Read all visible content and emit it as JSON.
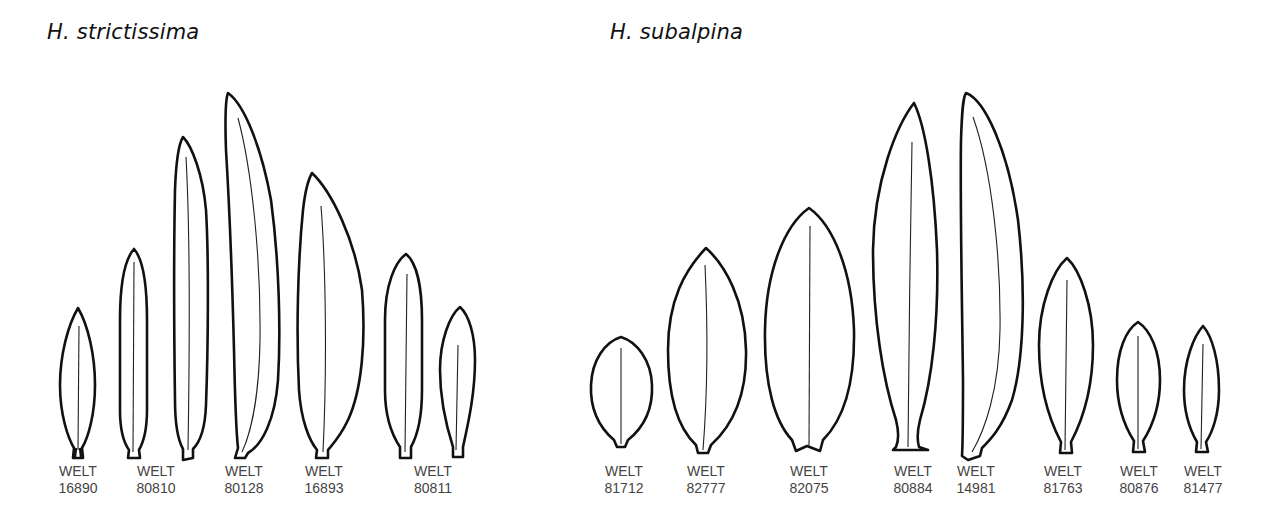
{
  "panels": [
    {
      "title": "H. strictissima",
      "specimens": [
        {
          "herbarium": "WELT",
          "number": "16890"
        },
        {
          "herbarium": "WELT",
          "number": "80810"
        },
        {
          "herbarium": "WELT",
          "number": "80128"
        },
        {
          "herbarium": "WELT",
          "number": "16893"
        },
        {
          "herbarium": "WELT",
          "number": "80811"
        }
      ],
      "leaf_count": 7
    },
    {
      "title": "H. subalpina",
      "specimens": [
        {
          "herbarium": "WELT",
          "number": "81712"
        },
        {
          "herbarium": "WELT",
          "number": "82777"
        },
        {
          "herbarium": "WELT",
          "number": "82075"
        },
        {
          "herbarium": "WELT",
          "number": "80884"
        },
        {
          "herbarium": "WELT",
          "number": "14981"
        },
        {
          "herbarium": "WELT",
          "number": "81763"
        },
        {
          "herbarium": "WELT",
          "number": "80876"
        },
        {
          "herbarium": "WELT",
          "number": "81477"
        }
      ],
      "leaf_count": 8
    }
  ],
  "colors": {
    "outline": "#111111",
    "label_text": "#444444",
    "background": "#ffffff"
  }
}
